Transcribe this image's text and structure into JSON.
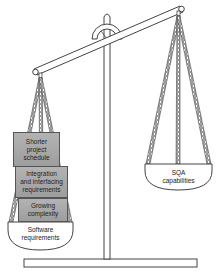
{
  "diagram": {
    "type": "balance-scale",
    "left_pan": {
      "label": "Software requirements",
      "label_line1": "Software",
      "label_line2": "requirements",
      "weights": [
        {
          "label": "Shorter project schedule",
          "line1": "Shorter",
          "line2": "project",
          "line3": "schedule"
        },
        {
          "label": "Integration and interfacing requirements",
          "line1": "Integration",
          "line2": "and interfacing",
          "line3": "requirements"
        },
        {
          "label": "Growing complexity",
          "line1": "Growing",
          "line2": "complexity"
        }
      ]
    },
    "right_pan": {
      "label": "SQA capabilities",
      "label_line1": "SQA",
      "label_line2": "capabilities"
    },
    "tilt": "left side lower (heavier)"
  },
  "colors": {
    "outline": "#333333",
    "box_fill": "#a8a8a8",
    "chain": "#555555",
    "background": "#ffffff"
  }
}
